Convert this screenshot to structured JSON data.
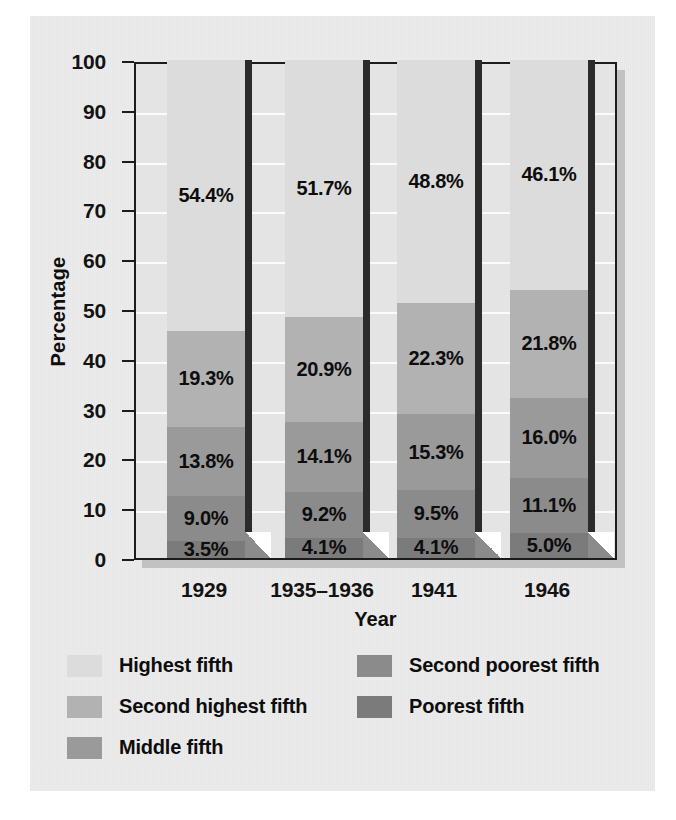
{
  "figure": {
    "background_color": "#ececec",
    "page_color": "#ffffff"
  },
  "chart_data": {
    "type": "bar",
    "subtype": "stacked-bar-100",
    "title": "",
    "subtitle": "",
    "xlabel": "Year",
    "ylabel": "Percentage",
    "categories": [
      "1929",
      "1935–1936",
      "1941",
      "1946"
    ],
    "ylim": [
      0,
      100
    ],
    "yticks": [
      0,
      10,
      20,
      30,
      40,
      50,
      60,
      70,
      80,
      90,
      100
    ],
    "ytick_labels": [
      "0",
      "10",
      "20",
      "30",
      "40",
      "50",
      "60",
      "70",
      "80",
      "90",
      "100"
    ],
    "grid": true,
    "grid_color": "#fbfbfb",
    "legend_position": "below",
    "stack_order_bottom_to_top": [
      "Poorest fifth",
      "Second poorest fifth",
      "Middle fifth",
      "Second highest fifth",
      "Highest fifth"
    ],
    "series": [
      {
        "name": "Highest fifth",
        "color": "#dcdcdc",
        "values": [
          54.4,
          51.7,
          48.8,
          46.1
        ],
        "labels": [
          "54.4%",
          "51.7%",
          "48.8%",
          "46.1%"
        ]
      },
      {
        "name": "Second highest fifth",
        "color": "#b2b2b2",
        "values": [
          19.3,
          20.9,
          22.3,
          21.8
        ],
        "labels": [
          "19.3%",
          "20.9%",
          "22.3%",
          "21.8%"
        ]
      },
      {
        "name": "Middle fifth",
        "color": "#9a9a9a",
        "values": [
          13.8,
          14.1,
          15.3,
          16.0
        ],
        "labels": [
          "13.8%",
          "14.1%",
          "15.3%",
          "16.0%"
        ]
      },
      {
        "name": "Second poorest fifth",
        "color": "#8b8b8b",
        "values": [
          9.0,
          9.2,
          9.5,
          11.1
        ],
        "labels": [
          "9.0%",
          "9.2%",
          "9.5%",
          "11.1%"
        ]
      },
      {
        "name": "Poorest fifth",
        "color": "#7b7b7b",
        "values": [
          3.5,
          4.1,
          4.1,
          5.0
        ],
        "labels": [
          "3.5%",
          "4.1%",
          "4.1%",
          "5.0%"
        ]
      }
    ],
    "column_totals": [
      100.0,
      100.0,
      100.0,
      100.0
    ]
  },
  "legend": {
    "left_column": [
      {
        "label": "Highest fifth",
        "color": "#dcdcdc"
      },
      {
        "label": "Second highest fifth",
        "color": "#b2b2b2"
      },
      {
        "label": "Middle fifth",
        "color": "#9a9a9a"
      }
    ],
    "right_column": [
      {
        "label": "Second poorest fifth",
        "color": "#8b8b8b"
      },
      {
        "label": "Poorest fifth",
        "color": "#7b7b7b"
      }
    ]
  }
}
